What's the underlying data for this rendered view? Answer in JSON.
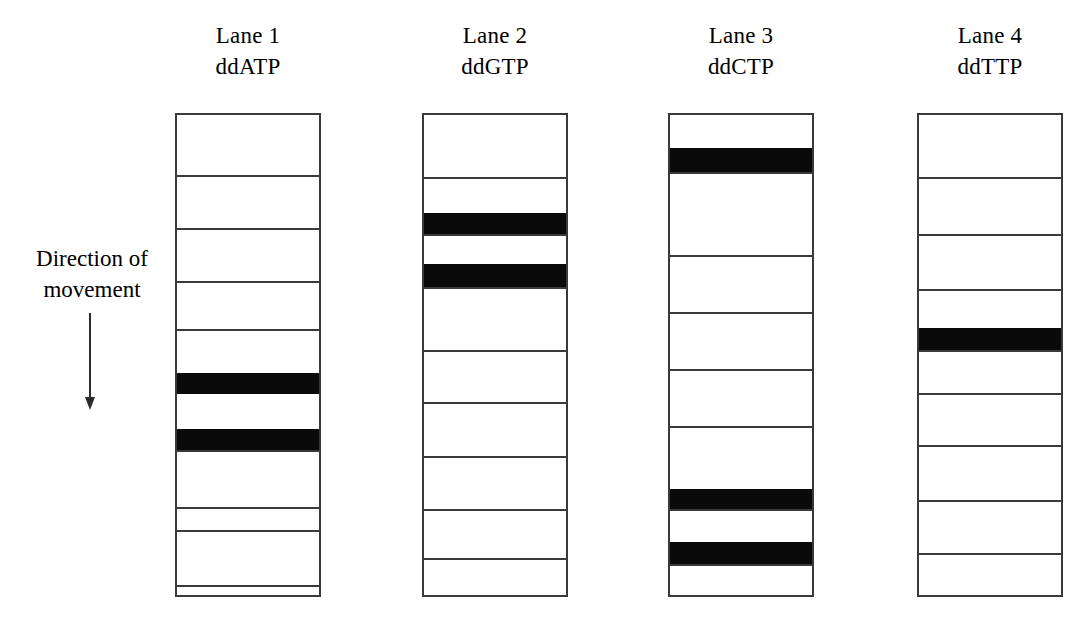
{
  "figure": {
    "type": "sanger-sequencing-gel-diagram",
    "background_color": "#ffffff",
    "band_color": "#0a0a0a",
    "outline_color": "#3a3a3a",
    "annotation": {
      "line1": "Direction of",
      "line2": "movement",
      "arrow_direction": "down",
      "arrow_icon": "down-arrow-icon"
    },
    "lanes": [
      {
        "id": "lane-1",
        "title": "Lane 1",
        "subtitle": "ddATP",
        "x": 175,
        "y": 113,
        "width": 146,
        "height": 484,
        "rows": 10,
        "dividers": [
          60,
          113,
          166,
          214,
          258,
          314,
          335,
          392,
          415,
          470,
          520
        ],
        "bands": [
          {
            "top": 258,
            "height": 21,
            "row": 6
          },
          {
            "top": 314,
            "height": 21,
            "row": 8
          }
        ]
      },
      {
        "id": "lane-2",
        "title": "Lane 2",
        "subtitle": "ddGTP",
        "x": 422,
        "y": 113,
        "width": 146,
        "height": 484,
        "rows": 10,
        "dividers": [
          62,
          98,
          119,
          149,
          172,
          235,
          287,
          341,
          394,
          443
        ],
        "bands": [
          {
            "top": 98,
            "height": 21,
            "row": 3
          },
          {
            "top": 149,
            "height": 23,
            "row": 5
          }
        ]
      },
      {
        "id": "lane-3",
        "title": "Lane 3",
        "subtitle": "ddCTP",
        "x": 668,
        "y": 113,
        "width": 146,
        "height": 484,
        "rows": 10,
        "dividers": [
          33,
          57,
          140,
          197,
          254,
          311,
          374,
          394,
          427,
          449
        ],
        "bands": [
          {
            "top": 33,
            "height": 24,
            "row": 2
          },
          {
            "top": 374,
            "height": 20,
            "row": 8
          },
          {
            "top": 427,
            "height": 22,
            "row": 10
          }
        ]
      },
      {
        "id": "lane-4",
        "title": "Lane 4",
        "subtitle": "ddTTP",
        "x": 917,
        "y": 113,
        "width": 146,
        "height": 484,
        "rows": 9,
        "dividers": [
          62,
          119,
          174,
          213,
          235,
          278,
          330,
          385,
          438
        ],
        "bands": [
          {
            "top": 213,
            "height": 22,
            "row": 5
          }
        ]
      }
    ]
  }
}
